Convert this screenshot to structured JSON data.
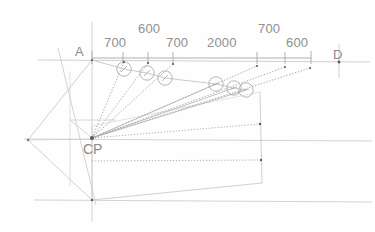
{
  "drawing": {
    "title": "Perspective construction layout",
    "background_color": "#fefefe",
    "line_color": "#b9b9b9",
    "line_color_light": "#cfcfcf",
    "ray_color": "#8f8f8f",
    "text_color": "#8e8e8e",
    "point_color": "#5a5a5a"
  },
  "dimensions": {
    "units": "mm",
    "chain": [
      {
        "id": "d1",
        "value": "700",
        "x": 112,
        "y": 43
      },
      {
        "id": "d2",
        "value": "600",
        "x": 146,
        "y": 29
      },
      {
        "id": "d3",
        "value": "700",
        "x": 174,
        "y": 43
      },
      {
        "id": "d4",
        "value": "2000",
        "x": 223,
        "y": 43
      },
      {
        "id": "d5",
        "value": "700",
        "x": 275,
        "y": 29
      },
      {
        "id": "d6",
        "value": "600",
        "x": 302,
        "y": 43
      }
    ],
    "tick_positions_x": [
      92,
      123,
      148,
      173,
      257,
      285,
      310
    ],
    "baseline_y": 58
  },
  "labels": {
    "point_a": {
      "text": "A",
      "x": 76,
      "y": 46
    },
    "point_d": {
      "text": "D",
      "x": 334,
      "y": 49
    },
    "center_point": {
      "text": "CP",
      "x": 84,
      "y": 143
    }
  },
  "key_points": {
    "a": {
      "x": 92,
      "y": 60
    },
    "d": {
      "x": 339,
      "y": 62
    },
    "cp": {
      "x": 92,
      "y": 138
    },
    "left_vertex": {
      "x": 28,
      "y": 140
    },
    "bottom_vertex": {
      "x": 92,
      "y": 200
    }
  },
  "markers": {
    "note": "small circles with internal tick marking measured points on projection rays",
    "radius": 7.5,
    "items": [
      {
        "id": "m1",
        "x": 124,
        "y": 69
      },
      {
        "id": "m2",
        "x": 147,
        "y": 73
      },
      {
        "id": "m3",
        "x": 165,
        "y": 78
      },
      {
        "id": "m4",
        "x": 216,
        "y": 84
      },
      {
        "id": "m5",
        "x": 234,
        "y": 88
      },
      {
        "id": "m6",
        "x": 246,
        "y": 90
      }
    ]
  },
  "rays": {
    "note": "dotted construction rays fanning out from CP to measured points on the picture plane",
    "targets": [
      {
        "x": 124,
        "y": 62
      },
      {
        "x": 148,
        "y": 63
      },
      {
        "x": 173,
        "y": 64
      },
      {
        "x": 257,
        "y": 66
      },
      {
        "x": 285,
        "y": 67
      },
      {
        "x": 310,
        "y": 68
      }
    ]
  },
  "guides": {
    "horizon_y": 60,
    "mid_horizontal_y": 139,
    "ground_y": 200,
    "vertical_x": 92,
    "right_vertical_x": 339
  }
}
